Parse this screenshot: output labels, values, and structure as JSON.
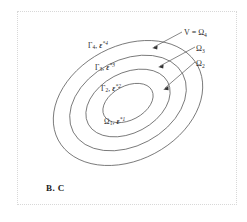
{
  "figure": {
    "caption": "B. C",
    "frame_style": "dotted",
    "frame_color": "#d8d8d8",
    "background": "#ffffff",
    "line_color": "#555555"
  },
  "regions": [
    {
      "id": "omega1",
      "name": "innermost-region",
      "gamma": "",
      "omega": "Ω",
      "omega_sub": "1",
      "epsilon": "ε",
      "epsilon_sup": "*1",
      "label_text": "Ω₁, ε*1",
      "separator": ", "
    },
    {
      "id": "gamma2",
      "name": "second-boundary",
      "gamma": "Γ",
      "gamma_sub": "2",
      "epsilon": "ε",
      "epsilon_sup": "*2",
      "label_text": "Γ₂, ε*2",
      "separator": ", "
    },
    {
      "id": "gamma3",
      "name": "third-boundary",
      "gamma": "Γ",
      "gamma_sub": "3",
      "epsilon": "ε",
      "epsilon_sup": "*3",
      "label_text": "Γ₃, ε*3",
      "separator": ", "
    },
    {
      "id": "gamma4",
      "name": "fourth-boundary",
      "gamma": "Γ",
      "gamma_sub": "4",
      "epsilon": "ε",
      "epsilon_sup": "*4",
      "label_text": "Γ₄, ε*4",
      "separator": ", "
    }
  ],
  "annotations": [
    {
      "id": "v-omega4",
      "name": "outer-domain-annotation",
      "prefix": "V = ",
      "symbol": "Ω",
      "subscript": "4"
    },
    {
      "id": "omega3",
      "name": "omega3-annotation",
      "prefix": "",
      "symbol": "Ω",
      "subscript": "3"
    },
    {
      "id": "omega2",
      "name": "omega2-annotation",
      "prefix": "",
      "symbol": "Ω",
      "subscript": "2"
    }
  ]
}
